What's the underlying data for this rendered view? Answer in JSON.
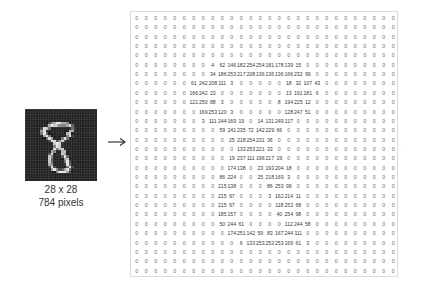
{
  "image_panel": {
    "caption_line1": "28 x 28",
    "caption_line2": "784 pixels",
    "background_color": "#1a1a1a",
    "stroke_color": "#e8e8e8"
  },
  "arrow_icon": "right-arrow",
  "side_mark": ",",
  "matrix": {
    "rows": 28,
    "cols": 28,
    "values": [
      [
        0,
        0,
        0,
        0,
        0,
        0,
        0,
        0,
        0,
        0,
        0,
        0,
        0,
        0,
        0,
        0,
        0,
        0,
        0,
        0,
        0,
        0,
        0,
        0,
        0,
        0,
        0,
        0
      ],
      [
        0,
        0,
        0,
        0,
        0,
        0,
        0,
        0,
        0,
        0,
        0,
        0,
        0,
        0,
        0,
        0,
        0,
        0,
        0,
        0,
        0,
        0,
        0,
        0,
        0,
        0,
        0,
        0
      ],
      [
        0,
        0,
        0,
        0,
        0,
        0,
        0,
        0,
        0,
        0,
        0,
        0,
        0,
        0,
        0,
        0,
        0,
        0,
        0,
        0,
        0,
        0,
        0,
        0,
        0,
        0,
        0,
        0
      ],
      [
        0,
        0,
        0,
        0,
        0,
        0,
        0,
        0,
        0,
        0,
        0,
        0,
        0,
        0,
        0,
        0,
        0,
        0,
        0,
        0,
        0,
        0,
        0,
        0,
        0,
        0,
        0,
        0
      ],
      [
        0,
        0,
        0,
        0,
        0,
        0,
        0,
        0,
        0,
        0,
        0,
        0,
        0,
        0,
        0,
        0,
        0,
        0,
        0,
        0,
        0,
        0,
        0,
        0,
        0,
        0,
        0,
        0
      ],
      [
        0,
        0,
        0,
        0,
        0,
        0,
        0,
        0,
        4,
        62,
        146,
        182,
        254,
        254,
        181,
        178,
        139,
        15,
        0,
        0,
        0,
        0,
        0,
        0,
        0,
        0,
        0,
        0
      ],
      [
        0,
        0,
        0,
        0,
        0,
        0,
        0,
        0,
        34,
        186,
        253,
        217,
        208,
        136,
        136,
        136,
        166,
        232,
        99,
        0,
        0,
        0,
        0,
        0,
        0,
        0,
        0,
        0
      ],
      [
        0,
        0,
        0,
        0,
        0,
        0,
        61,
        242,
        208,
        111,
        3,
        0,
        0,
        0,
        0,
        0,
        18,
        32,
        107,
        43,
        0,
        0,
        0,
        0,
        0,
        0,
        0,
        0
      ],
      [
        0,
        0,
        0,
        0,
        0,
        0,
        166,
        242,
        23,
        0,
        0,
        0,
        0,
        0,
        0,
        0,
        13,
        191,
        181,
        6,
        0,
        0,
        0,
        0,
        0,
        0,
        0,
        0
      ],
      [
        0,
        0,
        0,
        0,
        0,
        0,
        121,
        250,
        88,
        3,
        0,
        0,
        0,
        0,
        0,
        8,
        194,
        225,
        12,
        0,
        0,
        0,
        0,
        0,
        0,
        0,
        0,
        0
      ],
      [
        0,
        0,
        0,
        0,
        0,
        0,
        0,
        169,
        253,
        120,
        3,
        0,
        0,
        0,
        0,
        0,
        128,
        247,
        51,
        0,
        0,
        0,
        0,
        0,
        0,
        0,
        0,
        0
      ],
      [
        0,
        0,
        0,
        0,
        0,
        0,
        0,
        3,
        111,
        244,
        169,
        19,
        0,
        14,
        131,
        249,
        117,
        0,
        0,
        0,
        0,
        0,
        0,
        0,
        0,
        0,
        0,
        0
      ],
      [
        0,
        0,
        0,
        0,
        0,
        0,
        0,
        0,
        0,
        59,
        241,
        235,
        72,
        142,
        229,
        66,
        0,
        0,
        0,
        0,
        0,
        0,
        0,
        0,
        0,
        0,
        0,
        0
      ],
      [
        0,
        0,
        0,
        0,
        0,
        0,
        0,
        0,
        0,
        0,
        25,
        218,
        254,
        231,
        36,
        0,
        0,
        0,
        0,
        0,
        0,
        0,
        0,
        0,
        0,
        0,
        0,
        0
      ],
      [
        0,
        0,
        0,
        0,
        0,
        0,
        0,
        0,
        0,
        0,
        0,
        133,
        253,
        221,
        33,
        0,
        0,
        0,
        0,
        0,
        0,
        0,
        0,
        0,
        0,
        0,
        0,
        0
      ],
      [
        0,
        0,
        0,
        0,
        0,
        0,
        0,
        0,
        0,
        0,
        19,
        237,
        111,
        196,
        217,
        19,
        0,
        0,
        0,
        0,
        0,
        0,
        0,
        0,
        0,
        0,
        0,
        0
      ],
      [
        0,
        0,
        0,
        0,
        0,
        0,
        0,
        0,
        0,
        0,
        174,
        138,
        0,
        23,
        193,
        204,
        18,
        0,
        0,
        0,
        0,
        0,
        0,
        0,
        0,
        0,
        0,
        0
      ],
      [
        0,
        0,
        0,
        0,
        0,
        0,
        0,
        0,
        0,
        86,
        224,
        0,
        0,
        25,
        218,
        169,
        3,
        0,
        0,
        0,
        0,
        0,
        0,
        0,
        0,
        0,
        0,
        0
      ],
      [
        0,
        0,
        0,
        0,
        0,
        0,
        0,
        0,
        0,
        215,
        138,
        0,
        0,
        0,
        86,
        253,
        99,
        0,
        0,
        0,
        0,
        0,
        0,
        0,
        0,
        0,
        0,
        0
      ],
      [
        0,
        0,
        0,
        0,
        0,
        0,
        0,
        0,
        0,
        215,
        97,
        0,
        0,
        0,
        3,
        162,
        214,
        11,
        0,
        0,
        0,
        0,
        0,
        0,
        0,
        0,
        0,
        0
      ],
      [
        0,
        0,
        0,
        0,
        0,
        0,
        0,
        0,
        0,
        215,
        97,
        0,
        0,
        0,
        0,
        118,
        253,
        68,
        0,
        0,
        0,
        0,
        0,
        0,
        0,
        0,
        0,
        0
      ],
      [
        0,
        0,
        0,
        0,
        0,
        0,
        0,
        0,
        0,
        185,
        157,
        0,
        0,
        0,
        0,
        40,
        254,
        98,
        0,
        0,
        0,
        0,
        0,
        0,
        0,
        0,
        0,
        0
      ],
      [
        0,
        0,
        0,
        0,
        0,
        0,
        0,
        0,
        0,
        50,
        244,
        61,
        0,
        0,
        0,
        0,
        112,
        244,
        58,
        0,
        0,
        0,
        0,
        0,
        0,
        0,
        0,
        0
      ],
      [
        0,
        0,
        0,
        0,
        0,
        0,
        0,
        0,
        0,
        0,
        174,
        251,
        142,
        59,
        83,
        167,
        244,
        111,
        0,
        0,
        0,
        0,
        0,
        0,
        0,
        0,
        0,
        0
      ],
      [
        0,
        0,
        0,
        0,
        0,
        0,
        0,
        0,
        0,
        0,
        0,
        6,
        133,
        253,
        253,
        253,
        169,
        61,
        3,
        0,
        0,
        0,
        0,
        0,
        0,
        0,
        0,
        0
      ],
      [
        0,
        0,
        0,
        0,
        0,
        0,
        0,
        0,
        0,
        0,
        0,
        0,
        0,
        0,
        0,
        0,
        0,
        0,
        0,
        0,
        0,
        0,
        0,
        0,
        0,
        0,
        0,
        0
      ],
      [
        0,
        0,
        0,
        0,
        0,
        0,
        0,
        0,
        0,
        0,
        0,
        0,
        0,
        0,
        0,
        0,
        0,
        0,
        0,
        0,
        0,
        0,
        0,
        0,
        0,
        0,
        0,
        0
      ],
      [
        0,
        0,
        0,
        0,
        0,
        0,
        0,
        0,
        0,
        0,
        0,
        0,
        0,
        0,
        0,
        0,
        0,
        0,
        0,
        0,
        0,
        0,
        0,
        0,
        0,
        0,
        0,
        0
      ]
    ]
  }
}
